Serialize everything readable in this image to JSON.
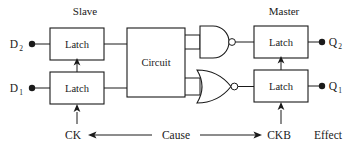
{
  "diagram": {
    "headings": {
      "slave": "Slave",
      "master": "Master"
    },
    "inputs": [
      {
        "name": "D2",
        "base": "D",
        "sub": "2"
      },
      {
        "name": "D1",
        "base": "D",
        "sub": "1"
      }
    ],
    "outputs": [
      {
        "name": "Q2",
        "base": "Q",
        "sub": "2"
      },
      {
        "name": "Q1",
        "base": "Q",
        "sub": "1"
      }
    ],
    "blocks": {
      "latch_slave_top": "Latch",
      "latch_slave_bottom": "Latch",
      "circuit": "Circuit",
      "latch_master_top": "Latch",
      "latch_master_bottom": "Latch"
    },
    "gates": [
      {
        "id": "nand-gate",
        "type": "NAND",
        "inputs": 2,
        "inverted": true
      },
      {
        "id": "nor-gate",
        "type": "NOR",
        "inputs": 2,
        "inverted": true
      }
    ],
    "clocks": {
      "ck": "CK",
      "ckb": "CKB"
    },
    "annotations": {
      "cause": "Cause",
      "effect": "Effect"
    },
    "colors": {
      "stroke": "#1a1a1a",
      "fill": "#ffffff",
      "text": "#1a1a1a"
    }
  }
}
